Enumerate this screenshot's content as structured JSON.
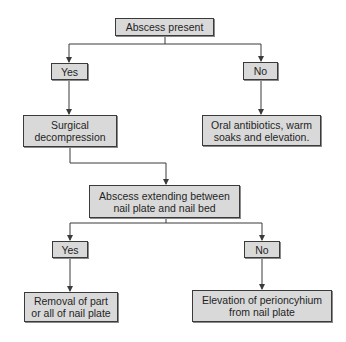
{
  "flowchart": {
    "root": {
      "label": "Abscess present"
    },
    "level1": {
      "yes": {
        "label": "Yes"
      },
      "no": {
        "label": "No"
      }
    },
    "level1_outcomes": {
      "yes": {
        "label": "Surgical\ndecompression"
      },
      "no": {
        "label": "Oral antibiotics, warm\nsoaks and elevation."
      }
    },
    "decision2": {
      "label": "Abscess extending between\nnail plate and nail bed"
    },
    "level2": {
      "yes": {
        "label": "Yes"
      },
      "no": {
        "label": "No"
      }
    },
    "level2_outcomes": {
      "yes": {
        "label": "Removal of part\nor all of nail plate"
      },
      "no": {
        "label": "Elevation of perioncyhium\nfrom nail plate"
      }
    }
  },
  "colors": {
    "box_fill": "#d9d9d9",
    "box_border": "#3a3a3a",
    "line": "#3a3a3a",
    "background": "#ffffff"
  }
}
